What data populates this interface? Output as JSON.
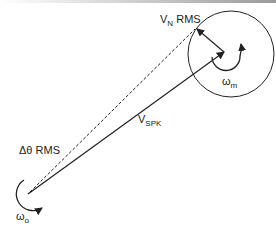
{
  "diagram": {
    "labels": {
      "vn": {
        "main": "V",
        "sub": "N",
        "suffix": " RMS"
      },
      "vspk": {
        "main": "V",
        "sub": "SPK"
      },
      "dtheta": {
        "text": "Δθ RMS"
      },
      "omega_m": {
        "main": "ω",
        "sub": "m"
      },
      "omega_o": {
        "main": "ω",
        "sub": "o"
      }
    },
    "colors": {
      "stroke": "#222222",
      "background": "#ffffff"
    }
  }
}
